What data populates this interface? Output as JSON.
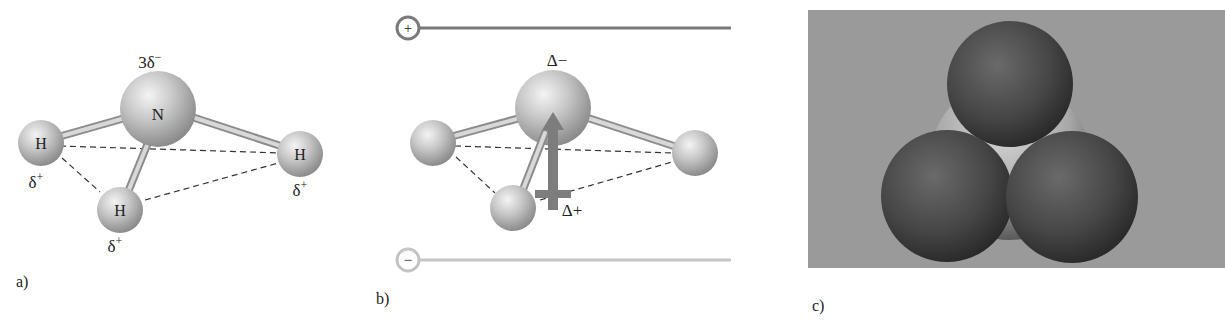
{
  "figure": {
    "panels": [
      {
        "id": "a",
        "label": "a)",
        "central_atom": "N",
        "central_charge": "3δ",
        "central_charge_sign": "−",
        "hydrogens": [
          {
            "symbol": "H",
            "charge": "δ",
            "charge_sign": "+"
          },
          {
            "symbol": "H",
            "charge": "δ",
            "charge_sign": "+"
          },
          {
            "symbol": "H",
            "charge": "δ",
            "charge_sign": "+"
          }
        ]
      },
      {
        "id": "b",
        "label": "b)",
        "plate_top_sign": "+",
        "plate_bottom_sign": "−",
        "top_label": "Δ−",
        "bottom_label": "Δ+"
      },
      {
        "id": "c",
        "label": "c)"
      }
    ],
    "colors": {
      "background": "#ffffff",
      "plate_positive": "#7a7a7a",
      "plate_negative": "#c4c4c4",
      "dipole_arrow": "#7d7d7d",
      "spacefill_bg": "#9a9a9a",
      "spacefill_h": "#4a4a4a",
      "spacefill_n": "#b5b5b5"
    }
  }
}
